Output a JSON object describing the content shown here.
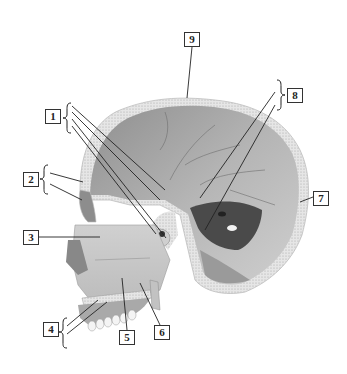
{
  "figure": {
    "labels": [
      {
        "id": "1",
        "text": "1",
        "x": 45,
        "y": 109
      },
      {
        "id": "2",
        "text": "2",
        "x": 23,
        "y": 172
      },
      {
        "id": "3",
        "text": "3",
        "x": 23,
        "y": 230
      },
      {
        "id": "4",
        "text": "4",
        "x": 43,
        "y": 322
      },
      {
        "id": "5",
        "text": "5",
        "x": 119,
        "y": 330
      },
      {
        "id": "6",
        "text": "6",
        "x": 154,
        "y": 325
      },
      {
        "id": "7",
        "text": "7",
        "x": 313,
        "y": 191
      },
      {
        "id": "8",
        "text": "8",
        "x": 287,
        "y": 88
      },
      {
        "id": "9",
        "text": "9",
        "x": 184,
        "y": 32
      }
    ]
  }
}
